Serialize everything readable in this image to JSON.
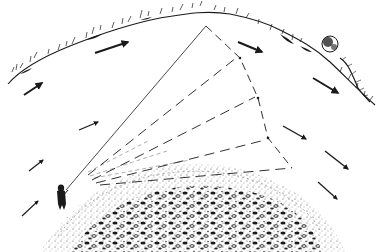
{
  "illustration": {
    "title": "Fly fisherman casting across a current, showing the drift swing of the line",
    "background": "#ffffff",
    "ink": "#1a1a1a",
    "far_bank": {
      "icon": "grass-bank-icon"
    },
    "bush": {
      "icon": "bush-icon"
    },
    "near_bank": {
      "icon": "gravel-bank-icon"
    },
    "angler": {
      "icon": "angler-icon"
    },
    "cast_line": {
      "from": [
        66,
        190
      ],
      "to": [
        206,
        26
      ]
    },
    "drift_lines": [
      {
        "from": [
          88,
          175
        ],
        "to": [
          236,
          58
        ]
      },
      {
        "from": [
          92,
          180
        ],
        "to": [
          255,
          97
        ]
      },
      {
        "from": [
          96,
          183
        ],
        "to": [
          265,
          140
        ]
      },
      {
        "from": [
          100,
          185
        ],
        "to": [
          292,
          168
        ]
      }
    ],
    "current_arrows": [
      {
        "x1": 95,
        "y1": 53,
        "x2": 128,
        "y2": 42
      },
      {
        "x1": 24,
        "y1": 95,
        "x2": 42,
        "y2": 83
      },
      {
        "x1": 79,
        "y1": 130,
        "x2": 98,
        "y2": 122
      },
      {
        "x1": 29,
        "y1": 171,
        "x2": 43,
        "y2": 160
      },
      {
        "x1": 22,
        "y1": 216,
        "x2": 38,
        "y2": 201
      },
      {
        "x1": 238,
        "y1": 42,
        "x2": 262,
        "y2": 52
      },
      {
        "x1": 313,
        "y1": 78,
        "x2": 338,
        "y2": 93
      },
      {
        "x1": 283,
        "y1": 126,
        "x2": 306,
        "y2": 139
      },
      {
        "x1": 325,
        "y1": 151,
        "x2": 348,
        "y2": 169
      },
      {
        "x1": 318,
        "y1": 182,
        "x2": 337,
        "y2": 199
      }
    ]
  }
}
